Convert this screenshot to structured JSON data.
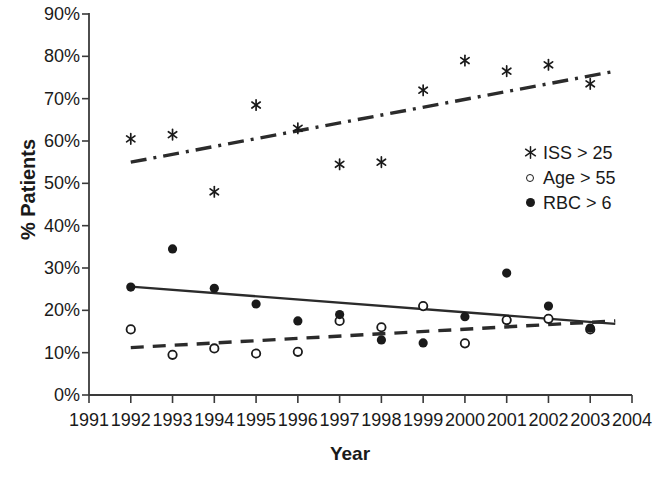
{
  "chart_data": {
    "type": "scatter",
    "title": "",
    "xlabel": "Year",
    "ylabel": "% Patients",
    "xlim": [
      1991,
      2004
    ],
    "ylim": [
      0,
      90
    ],
    "grid": false,
    "legend_position": "right-middle",
    "x_tick_labels": [
      "1991",
      "1992",
      "1993",
      "1994",
      "1995",
      "1996",
      "1997",
      "1998",
      "1999",
      "2000",
      "2001",
      "2002",
      "2003",
      "2004"
    ],
    "y_tick_labels": [
      "0%",
      "10%",
      "20%",
      "30%",
      "40%",
      "50%",
      "60%",
      "70%",
      "80%",
      "90%"
    ],
    "y_tick_values": [
      0,
      10,
      20,
      30,
      40,
      50,
      60,
      70,
      80,
      90
    ],
    "x": [
      1992,
      1993,
      1994,
      1995,
      1996,
      1997,
      1998,
      1999,
      2000,
      2001,
      2002,
      2003
    ],
    "series": [
      {
        "name": "ISS > 25",
        "marker": "asterisk",
        "values": [
          60.5,
          61.5,
          48.0,
          68.5,
          63.0,
          54.5,
          55.0,
          72.0,
          79.0,
          76.5,
          78.0,
          73.5
        ],
        "trend": {
          "style": "dash-dot",
          "x0": 1992,
          "y0": 55.0,
          "x1": 2003.6,
          "y1": 76.5
        }
      },
      {
        "name": "Age > 55",
        "marker": "open-circle",
        "values": [
          15.5,
          9.5,
          11.0,
          9.8,
          10.2,
          17.5,
          16.0,
          21.0,
          12.2,
          17.7,
          18.0,
          15.5
        ],
        "trend": {
          "style": "dashed",
          "x0": 1992,
          "y0": 11.2,
          "x1": 2003.6,
          "y1": 17.5
        }
      },
      {
        "name": "RBC > 6",
        "marker": "filled-circle",
        "values": [
          25.5,
          34.5,
          25.2,
          21.5,
          17.5,
          19.0,
          13.0,
          12.3,
          18.5,
          28.8,
          21.0,
          15.8
        ],
        "trend": {
          "style": "solid",
          "x0": 1992,
          "y0": 25.6,
          "x1": 2003.6,
          "y1": 16.8
        }
      }
    ]
  },
  "legend": {
    "items": [
      {
        "label": "ISS > 25",
        "marker": "asterisk",
        "glyph": "✳"
      },
      {
        "label": "Age > 55",
        "marker": "open-circle",
        "glyph": "○"
      },
      {
        "label": "RBC > 6",
        "marker": "filled-circle",
        "glyph": "●"
      }
    ]
  },
  "colors": {
    "axis": "#3a3a3a",
    "marker": "#1a1a1a",
    "trend": "#2b2b2b",
    "background": "#ffffff"
  }
}
